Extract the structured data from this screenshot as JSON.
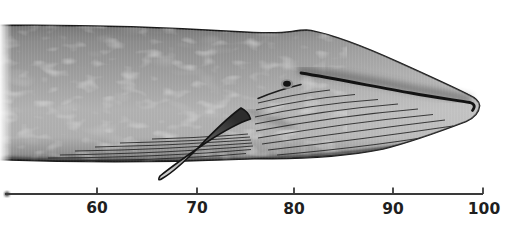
{
  "figure": {
    "colors": {
      "background": "#ffffff",
      "body_top": "#7d7d7d",
      "body_mid": "#a4a4a4",
      "body_light": "#b9b9b9",
      "body_shadow": "#5c5c5c",
      "outline": "#1a1a1a",
      "scale_line": "#3a3a3a",
      "label_text": "#1f1f1f"
    },
    "scale": {
      "ticks": [
        {
          "value": 60,
          "label": "60"
        },
        {
          "value": 70,
          "label": "70"
        },
        {
          "value": 80,
          "label": "80"
        },
        {
          "value": 90,
          "label": "90"
        },
        {
          "value": 100,
          "label": "100"
        }
      ]
    }
  }
}
